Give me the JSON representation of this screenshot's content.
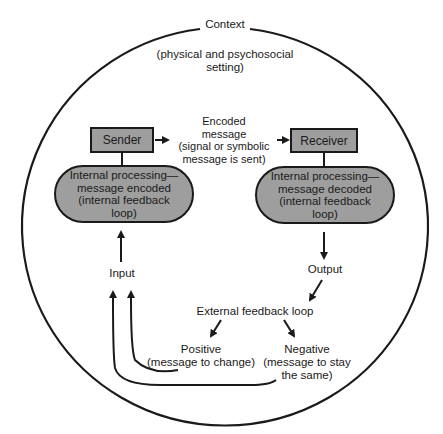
{
  "context": {
    "title": "Context",
    "subtitle_line1": "(physical and psychosocial",
    "subtitle_line2": "setting)"
  },
  "sender": {
    "label": "Sender",
    "processing": [
      "Internal processing—",
      "message encoded",
      "(internal feedback",
      "loop)"
    ]
  },
  "receiver": {
    "label": "Receiver",
    "processing": [
      "Internal processing—",
      "message decoded",
      "(internal feedback",
      "loop)"
    ]
  },
  "channel": {
    "lines": [
      "Encoded",
      "message",
      "(signal or symbolic",
      "message is sent)"
    ]
  },
  "input": {
    "label": "Input"
  },
  "output": {
    "label": "Output"
  },
  "feedback": {
    "label": "External feedback loop",
    "positive": {
      "title": "Positive",
      "desc": "(message to change)"
    },
    "negative": {
      "title": "Negative",
      "desc_line1": "(message to stay",
      "desc_line2": "the same)"
    }
  },
  "colors": {
    "fill": "#9e9e9e",
    "stroke": "#1a1a1a"
  }
}
